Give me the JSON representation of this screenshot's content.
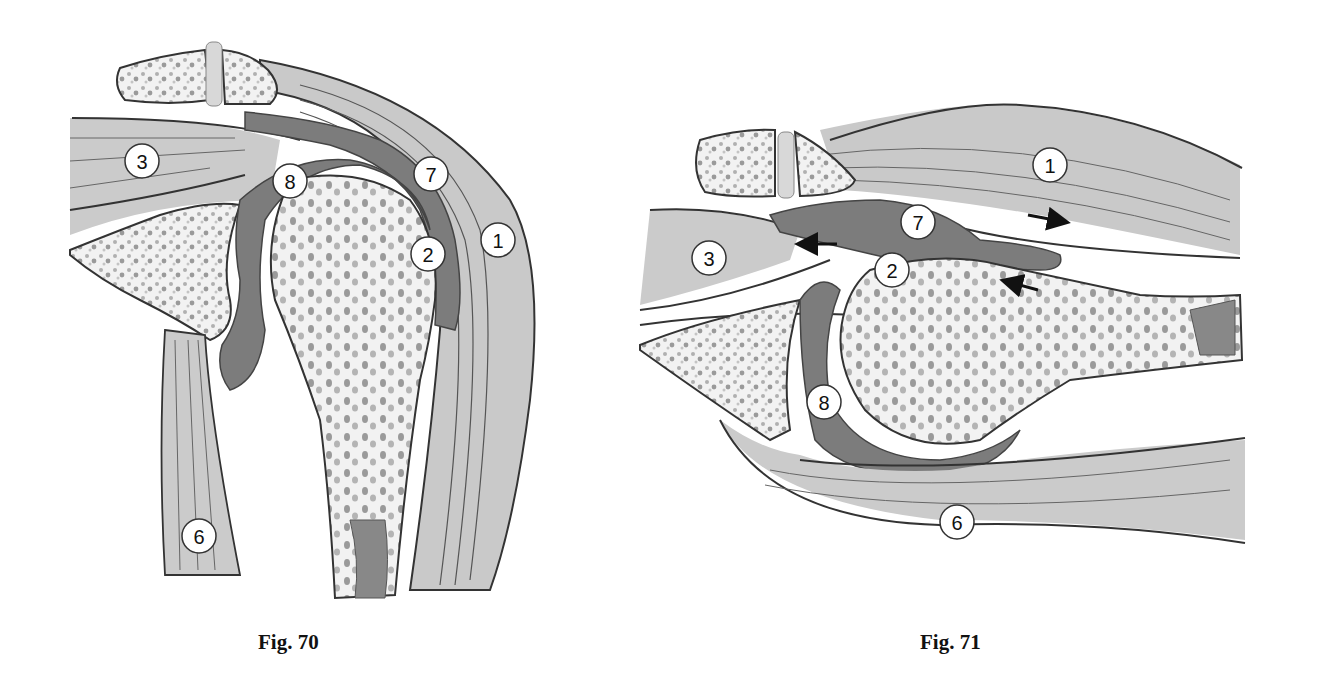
{
  "colors": {
    "outline": "#333333",
    "muscle": "#c9c9c9",
    "muscle_light": "#dcdcdc",
    "bone": "#f2f2f2",
    "bone_spots": "#a8a8a8",
    "dark_tissue": "#7c7c7c",
    "label_fill": "#ffffff"
  },
  "figures": [
    {
      "caption": "Fig. 70",
      "labels": [
        "1",
        "2",
        "3",
        "6",
        "7",
        "8"
      ]
    },
    {
      "caption": "Fig. 71",
      "labels": [
        "1",
        "2",
        "3",
        "6",
        "7",
        "8"
      ],
      "arrows": [
        "right",
        "left",
        "left-up"
      ]
    }
  ]
}
